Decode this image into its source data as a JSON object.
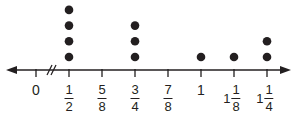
{
  "chart_data": {
    "type": "dot_plot",
    "title": "",
    "xlabel": "",
    "ylabel": "",
    "axis": {
      "break_between": [
        "0",
        "1/2"
      ],
      "arrows": "both",
      "ticks": [
        {
          "value": 0,
          "label": "0",
          "whole": "0",
          "num": "",
          "den": ""
        },
        {
          "value": 0.5,
          "label": "1/2",
          "whole": "",
          "num": "1",
          "den": "2"
        },
        {
          "value": 0.625,
          "label": "5/8",
          "whole": "",
          "num": "5",
          "den": "8"
        },
        {
          "value": 0.75,
          "label": "3/4",
          "whole": "",
          "num": "3",
          "den": "4"
        },
        {
          "value": 0.875,
          "label": "7/8",
          "whole": "",
          "num": "7",
          "den": "8"
        },
        {
          "value": 1,
          "label": "1",
          "whole": "1",
          "num": "",
          "den": ""
        },
        {
          "value": 1.125,
          "label": "1 1/8",
          "whole": "1",
          "num": "1",
          "den": "8"
        },
        {
          "value": 1.25,
          "label": "1 1/4",
          "whole": "1",
          "num": "1",
          "den": "4"
        }
      ]
    },
    "categories": [
      "0",
      "1/2",
      "5/8",
      "3/4",
      "7/8",
      "1",
      "1 1/8",
      "1 1/4"
    ],
    "values": [
      0,
      4,
      0,
      3,
      0,
      1,
      1,
      2
    ],
    "grid": false,
    "legend": null
  },
  "colors": {
    "ink": "#231f20",
    "background": "#ffffff"
  }
}
